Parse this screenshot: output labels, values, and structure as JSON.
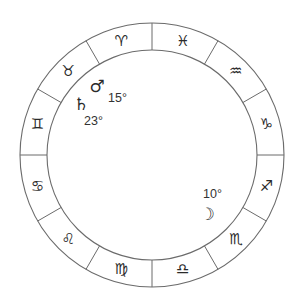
{
  "diagram": {
    "type": "zodiac-wheel",
    "center": [
      152,
      155
    ],
    "outer_radius": 132,
    "inner_radius": 105,
    "direction": "counterclockwise",
    "colors": {
      "line": "#6b6b6b",
      "glyph": "#2a2a2a",
      "text": "#333333"
    },
    "signs": [
      {
        "name": "Aries",
        "glyph": "♈",
        "icon": "aries-icon",
        "angle": 105
      },
      {
        "name": "Taurus",
        "glyph": "♉",
        "icon": "taurus-icon",
        "angle": 135
      },
      {
        "name": "Gemini",
        "glyph": "♊",
        "icon": "gemini-icon",
        "angle": 165
      },
      {
        "name": "Cancer",
        "glyph": "♋",
        "icon": "cancer-icon",
        "angle": 195
      },
      {
        "name": "Leo",
        "glyph": "♌",
        "icon": "leo-icon",
        "angle": 225
      },
      {
        "name": "Virgo",
        "glyph": "♍",
        "icon": "virgo-icon",
        "angle": 255
      },
      {
        "name": "Libra",
        "glyph": "♎",
        "icon": "libra-icon",
        "angle": 285
      },
      {
        "name": "Scorpio",
        "glyph": "♏",
        "icon": "scorpio-icon",
        "angle": 315
      },
      {
        "name": "Sagittarius",
        "glyph": "♐",
        "icon": "sagittarius-icon",
        "angle": 345
      },
      {
        "name": "Capricorn",
        "glyph": "♑",
        "icon": "capricorn-icon",
        "angle": 15
      },
      {
        "name": "Aquarius",
        "glyph": "♒",
        "icon": "aquarius-icon",
        "angle": 45
      },
      {
        "name": "Pisces",
        "glyph": "♓",
        "icon": "pisces-icon",
        "angle": 75
      }
    ],
    "planets": [
      {
        "name": "Mars",
        "glyph": "♂",
        "icon": "mars-icon",
        "degree": "15°",
        "sign": "Taurus",
        "glyph_pos": [
          97,
          86
        ],
        "label_pos": [
          108,
          98
        ]
      },
      {
        "name": "Saturn",
        "glyph": "♄",
        "icon": "saturn-icon",
        "degree": "23°",
        "sign": "Taurus",
        "glyph_pos": [
          81,
          104
        ],
        "label_pos": [
          84,
          121
        ]
      },
      {
        "name": "Moon",
        "glyph": "☽",
        "icon": "moon-icon",
        "degree": "10°",
        "sign": "Scorpio",
        "glyph_pos": [
          207,
          214
        ],
        "label_pos": [
          203,
          194
        ]
      }
    ]
  }
}
